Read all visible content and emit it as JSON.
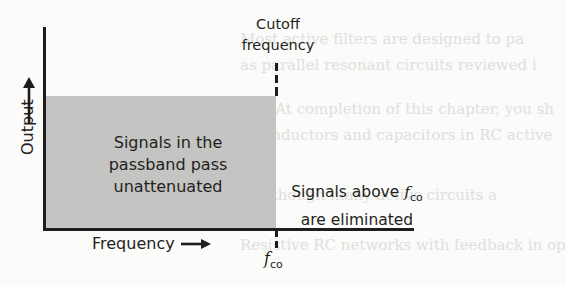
{
  "background_text": {
    "lines": [
      "Most active filters are designed to pa",
      "as parallel resonant circuits reviewed i",
      "",
      "ask. At completion of this chapter, you sh",
      "for inductors and capacitors in RC active",
      "",
      "ly although many active circuits a",
      "Resistive RC networks with feedback in op"
    ]
  },
  "diagram": {
    "cutoff_label_line1": "Cutoff",
    "cutoff_label_line2": "frequency",
    "passband_line1": "Signals in the",
    "passband_line2": "passband pass",
    "passband_line3": "unattenuated",
    "stopband_line1_prefix": "Signals above ",
    "stopband_f": "f",
    "stopband_sub": "co",
    "stopband_line2": "are eliminated",
    "x_axis_label": "Frequency",
    "y_axis_label": "Output",
    "cutoff_tick_f": "f",
    "cutoff_tick_sub": "co",
    "colors": {
      "passband_fill": "#c4c4c2",
      "axis": "#1f1c1d",
      "text": "#231f20",
      "background": "#fbfbfa"
    }
  }
}
